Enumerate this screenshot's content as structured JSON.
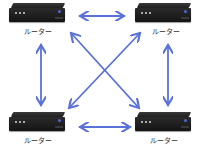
{
  "diagram": {
    "type": "network-mesh",
    "nodes": [
      {
        "id": "top-left",
        "label": "ルーター"
      },
      {
        "id": "top-right",
        "label": "ルーター"
      },
      {
        "id": "bottom-left",
        "label": "ルーター"
      },
      {
        "id": "bottom-right",
        "label": "ルーター"
      }
    ],
    "edges": [
      {
        "from": "top-left",
        "to": "top-right",
        "bidirectional": true
      },
      {
        "from": "bottom-left",
        "to": "bottom-right",
        "bidirectional": true
      },
      {
        "from": "top-left",
        "to": "bottom-left",
        "bidirectional": true
      },
      {
        "from": "top-right",
        "to": "bottom-right",
        "bidirectional": true
      },
      {
        "from": "top-left",
        "to": "bottom-right",
        "bidirectional": true
      },
      {
        "from": "top-right",
        "to": "bottom-left",
        "bidirectional": true
      }
    ],
    "arrow_color": "#5a72d8",
    "device_color": "#1e1e1e"
  }
}
